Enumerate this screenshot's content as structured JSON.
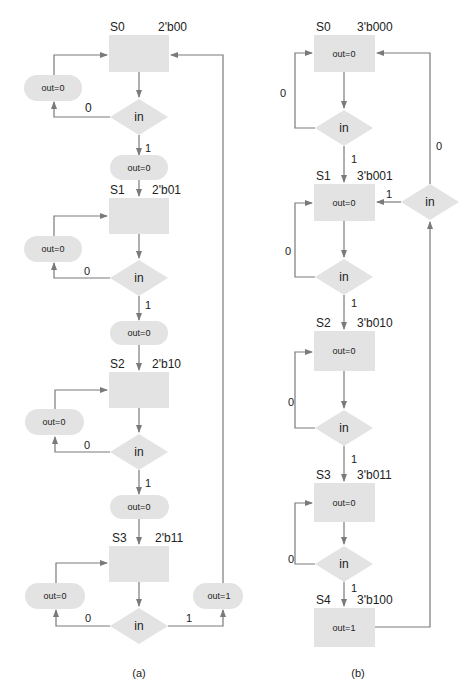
{
  "diagram_a": {
    "caption": "(a)",
    "states": [
      {
        "name": "S0",
        "code": "2'b00"
      },
      {
        "name": "S1",
        "code": "2'b01"
      },
      {
        "name": "S2",
        "code": "2'b10"
      },
      {
        "name": "S3",
        "code": "2'b11"
      }
    ],
    "decision_label": "in",
    "loop_output": "out=0",
    "forward_output": "out=0",
    "final_output": "out=1",
    "branch_zero": "0",
    "branch_one": "1"
  },
  "diagram_b": {
    "caption": "(b)",
    "states": [
      {
        "name": "S0",
        "code": "3'b000",
        "output": "out=0"
      },
      {
        "name": "S1",
        "code": "3'b001",
        "output": "out=0"
      },
      {
        "name": "S2",
        "code": "3'b010",
        "output": "out=0"
      },
      {
        "name": "S3",
        "code": "3'b011",
        "output": "out=0"
      },
      {
        "name": "S4",
        "code": "3'b100",
        "output": "out=1"
      }
    ],
    "decision_label": "in",
    "branch_zero": "0",
    "branch_one": "1"
  },
  "colors": {
    "shape_fill": "#e3e3e3",
    "line": "#7a7a7a",
    "text": "#222222"
  }
}
